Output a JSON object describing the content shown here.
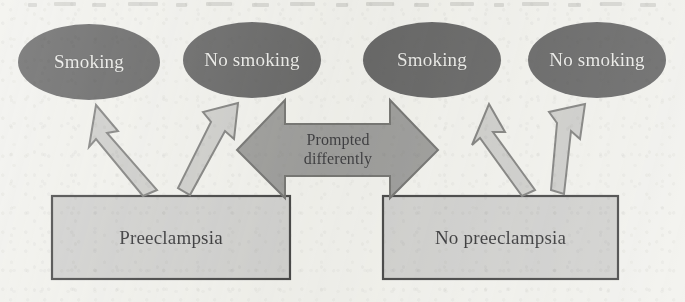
{
  "figure": {
    "type": "flow-diagram",
    "title": "",
    "background_color": "#efefea",
    "media": "scanned-page"
  },
  "palette": {
    "page_background": "#efefea",
    "ellipse_fill": "#4f4f50",
    "ellipse_text": "#e9e9e6",
    "box_fill": "#c9c9c7",
    "box_stroke": "#2a2a2c",
    "box_text": "#17171a",
    "arrow_fill": "#c6c6c3",
    "arrow_stroke": "#6e6e6c",
    "connector_fill": "#8d8d8b",
    "connector_stroke": "#5e5e5c",
    "connector_text": "#1c1c20"
  },
  "nodes": {
    "ellipses": [
      {
        "id": "smoking-left",
        "label": "Smoking",
        "cx": 89,
        "cy": 62,
        "rx": 71,
        "ry": 38
      },
      {
        "id": "no-smoking-left",
        "label": "No smoking",
        "cx": 252,
        "cy": 60,
        "rx": 69,
        "ry": 38
      },
      {
        "id": "smoking-right",
        "label": "Smoking",
        "cx": 432,
        "cy": 60,
        "rx": 69,
        "ry": 38
      },
      {
        "id": "no-smoking-right",
        "label": "No smoking",
        "cx": 597,
        "cy": 60,
        "rx": 69,
        "ry": 38
      }
    ],
    "boxes": [
      {
        "id": "preeclampsia",
        "label": "Preeclampsia",
        "x": 52,
        "y": 196,
        "w": 238,
        "h": 83
      },
      {
        "id": "no-preeclampsia",
        "label": "No preeclampsia",
        "x": 383,
        "y": 196,
        "w": 235,
        "h": 83
      }
    ]
  },
  "connectors": {
    "double_arrow": {
      "id": "prompted-differently",
      "label_line_1": "Prompted",
      "label_line_2": "differently",
      "label": "Prompted differently",
      "direction": "bidirectional",
      "left_tip_x": 237,
      "right_tip_x": 438,
      "center_y": 150
    },
    "arrows": [
      {
        "id": "preeclampsia-to-smoking",
        "from": "preeclampsia",
        "to": "smoking-left",
        "direction": "up-left"
      },
      {
        "id": "preeclampsia-to-no-smoking",
        "from": "preeclampsia",
        "to": "no-smoking-left",
        "direction": "up-right"
      },
      {
        "id": "no-preeclampsia-to-smoking",
        "from": "no-preeclampsia",
        "to": "smoking-right",
        "direction": "up-left"
      },
      {
        "id": "no-preeclampsia-to-no-smoking",
        "from": "no-preeclampsia",
        "to": "no-smoking-right",
        "direction": "up-right"
      }
    ]
  }
}
